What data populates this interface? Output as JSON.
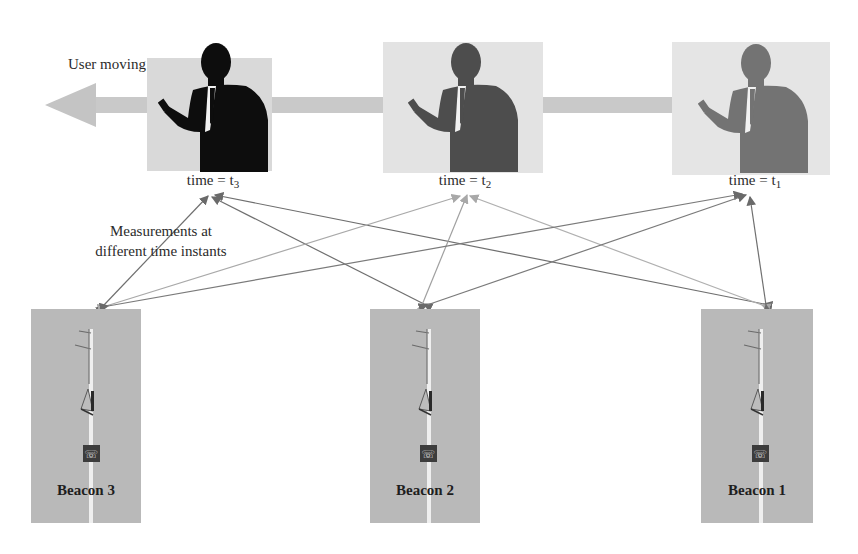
{
  "diagram": {
    "caption_user": "User moving",
    "caption_measurements": [
      "Measurements at",
      "different time instants"
    ],
    "direction": "right-to-left",
    "users": [
      {
        "id": "t3",
        "label_prefix": "time = t",
        "subscript": "3",
        "silhouette_color": "#0d0d0d",
        "panel_color": "#dcdcdc"
      },
      {
        "id": "t2",
        "label_prefix": "time = t",
        "subscript": "2",
        "silhouette_color": "#4a4a4a",
        "panel_color": "#e4e4e4"
      },
      {
        "id": "t1",
        "label_prefix": "time = t",
        "subscript": "1",
        "silhouette_color": "#6e6e6e",
        "panel_color": "#e6e6e6"
      }
    ],
    "beacons": [
      {
        "id": "beacon3",
        "name": "Beacon 3"
      },
      {
        "id": "beacon2",
        "name": "Beacon 2"
      },
      {
        "id": "beacon1",
        "name": "Beacon 1"
      }
    ],
    "links": [
      {
        "from": "t3",
        "to": "beacon3"
      },
      {
        "from": "t3",
        "to": "beacon2"
      },
      {
        "from": "t3",
        "to": "beacon1"
      },
      {
        "from": "t2",
        "to": "beacon3"
      },
      {
        "from": "t2",
        "to": "beacon2"
      },
      {
        "from": "t2",
        "to": "beacon1"
      },
      {
        "from": "t1",
        "to": "beacon3"
      },
      {
        "from": "t1",
        "to": "beacon2"
      },
      {
        "from": "t1",
        "to": "beacon1"
      }
    ],
    "colors": {
      "arrow_band": "#c8c8c8",
      "link_line": "#7a7a7a",
      "beacon_bg": "#b9b9b9"
    }
  }
}
